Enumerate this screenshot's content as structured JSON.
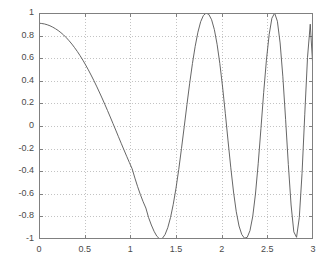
{
  "chart_data": {
    "type": "line",
    "title": "",
    "xlabel": "",
    "ylabel": "",
    "xlim": [
      0,
      3
    ],
    "ylim": [
      -1,
      1
    ],
    "grid": true,
    "grid_style": "dotted",
    "legend": null,
    "legend_position": "none",
    "line_color": "#555555",
    "background_color": "#ffffff",
    "axis_color": "#808080",
    "grid_color": "#b4b4b4",
    "xticks": [
      "0",
      "0.5",
      "1",
      "1.5",
      "2",
      "2.5",
      "3"
    ],
    "xtick_values": [
      0,
      0.5,
      1,
      1.5,
      2,
      2.5,
      3
    ],
    "yticks": [
      "1",
      "0.8",
      "0.6",
      "0.4",
      "0.2",
      "0",
      "-0.2",
      "-0.4",
      "-0.6",
      "-0.8",
      "-1"
    ],
    "ytick_values": [
      1,
      0.8,
      0.6,
      0.4,
      0.2,
      0,
      -0.2,
      -0.4,
      -0.6,
      -0.8,
      -1
    ],
    "annotations": [],
    "series": [
      {
        "name": "chirp",
        "x": [
          0,
          0.03,
          0.06,
          0.09,
          0.12,
          0.15,
          0.18,
          0.21,
          0.24,
          0.27,
          0.3,
          0.33,
          0.36,
          0.39,
          0.42,
          0.45,
          0.48,
          0.51,
          0.54,
          0.57,
          0.6,
          0.63,
          0.66,
          0.69,
          0.72,
          0.75,
          0.78,
          0.81,
          0.84,
          0.87,
          0.9,
          0.93,
          0.96,
          0.99,
          1.02,
          1.05,
          1.08,
          1.11,
          1.14,
          1.17,
          1.2,
          1.23,
          1.26,
          1.29,
          1.32,
          1.35,
          1.38,
          1.41,
          1.44,
          1.47,
          1.5,
          1.53,
          1.56,
          1.59,
          1.62,
          1.65,
          1.68,
          1.71,
          1.74,
          1.77,
          1.8,
          1.83,
          1.86,
          1.89,
          1.92,
          1.95,
          1.98,
          2.01,
          2.04,
          2.07,
          2.1,
          2.13,
          2.16,
          2.19,
          2.22,
          2.25,
          2.28,
          2.31,
          2.34,
          2.37,
          2.4,
          2.43,
          2.46,
          2.49,
          2.52,
          2.55,
          2.58,
          2.61,
          2.64,
          2.67,
          2.7,
          2.73,
          2.76,
          2.79,
          2.82,
          2.85,
          2.88,
          2.91,
          2.94,
          2.97,
          3
        ],
        "y": [
          0.91,
          0.907,
          0.903,
          0.896,
          0.887,
          0.875,
          0.861,
          0.845,
          0.826,
          0.805,
          0.781,
          0.754,
          0.725,
          0.693,
          0.659,
          0.622,
          0.583,
          0.541,
          0.497,
          0.451,
          0.403,
          0.353,
          0.301,
          0.248,
          0.193,
          0.137,
          0.08,
          0.022,
          -0.036,
          -0.095,
          -0.153,
          -0.211,
          -0.268,
          -0.324,
          -0.379,
          -0.461,
          -0.537,
          -0.607,
          -0.67,
          -0.726,
          -0.811,
          -0.876,
          -0.932,
          -0.975,
          -0.999,
          -0.995,
          -0.961,
          -0.9,
          -0.81,
          -0.693,
          -0.55,
          -0.385,
          -0.2,
          -0.006,
          0.19,
          0.379,
          0.553,
          0.705,
          0.83,
          0.923,
          0.978,
          0.999,
          0.987,
          0.94,
          0.853,
          0.723,
          0.552,
          0.345,
          0.112,
          -0.132,
          -0.37,
          -0.584,
          -0.759,
          -0.885,
          -0.96,
          -0.993,
          -0.985,
          -0.926,
          -0.801,
          -0.602,
          -0.334,
          -0.022,
          0.297,
          0.583,
          0.809,
          0.954,
          0.999,
          0.927,
          0.735,
          0.435,
          0.059,
          -0.341,
          -0.699,
          -0.937,
          -0.985,
          -0.81,
          -0.42,
          0.104,
          0.608,
          0.901,
          0.5
        ]
      }
    ]
  }
}
